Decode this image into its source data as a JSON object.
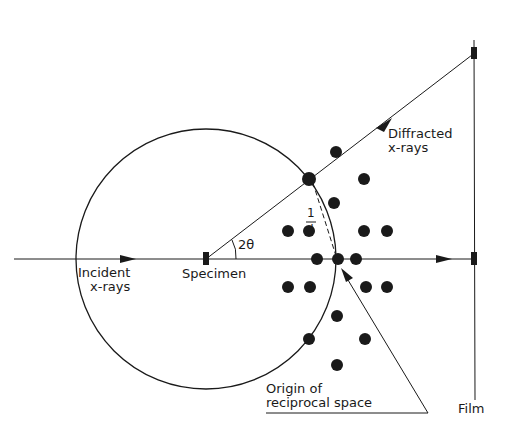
{
  "diagram": {
    "labels": {
      "incident_1": "Incident",
      "incident_2": "x-rays",
      "specimen": "Specimen",
      "diffracted_1": "Diffracted",
      "diffracted_2": "x-rays",
      "angle": "2θ",
      "d_num": "1",
      "d_den": "d",
      "origin_1": "Origin of",
      "origin_2": "reciprocal space",
      "film": "Film"
    },
    "colors": {
      "ink": "#1a1a1a",
      "background": "#ffffff"
    }
  }
}
